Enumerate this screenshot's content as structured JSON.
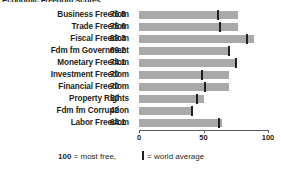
{
  "chart_data": {
    "type": "bar",
    "title": "Economic Freedom Scores",
    "xlabel": "",
    "ylabel": "",
    "orientation": "horizontal",
    "xlim": [
      0,
      100
    ],
    "grid": false,
    "categories": [
      "Business Freedom",
      "Trade Freedom",
      "Fiscal Freedom",
      "Fdm fm Government",
      "Monetary Freedom",
      "Investment Freedom",
      "Financial Freedom",
      "Property Rights",
      "Fdm fm Corruption",
      "Labor Freedom"
    ],
    "series": [
      {
        "name": "Score",
        "values": [
          76.8,
          76.6,
          89.3,
          69.2,
          74.1,
          70,
          70,
          50,
          42,
          64.1
        ]
      },
      {
        "name": "World average",
        "values": [
          61,
          63,
          84,
          70,
          75,
          49,
          51,
          45,
          41,
          62
        ]
      }
    ],
    "value_labels": [
      "76.8",
      "76.6",
      "89.3",
      "69.2",
      "74.1",
      "70",
      "70",
      "50",
      "42",
      "64.1"
    ],
    "ticks": [
      {
        "value": 0,
        "label": "0"
      },
      {
        "value": 50,
        "label": "50"
      },
      {
        "value": 100,
        "label": "100"
      }
    ],
    "legend": {
      "position": "bottom",
      "most_free_number": "100",
      "most_free_text": "= most free,",
      "world_average_text": "= world average"
    },
    "colors": {
      "bar_fill": "#a9a9a9",
      "avg_marker": "#231f20",
      "axis": "#58595b",
      "text": "#231f20",
      "background": "#ffffff"
    }
  }
}
